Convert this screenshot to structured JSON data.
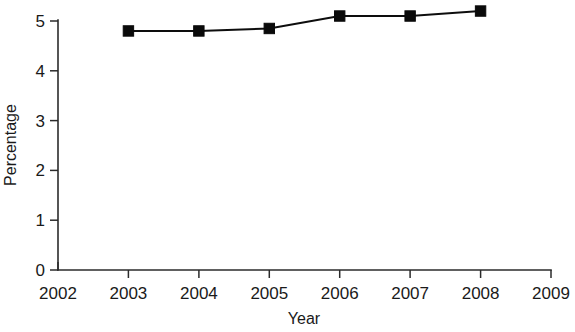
{
  "chart_data": {
    "type": "line",
    "title": "",
    "xlabel": "Year",
    "ylabel": "Percentage",
    "x": [
      2003,
      2004,
      2005,
      2006,
      2007,
      2008
    ],
    "values": [
      4.8,
      4.8,
      4.85,
      5.1,
      5.1,
      5.2
    ],
    "series": [
      {
        "name": "Percentage",
        "values": [
          4.8,
          4.8,
          4.85,
          5.1,
          5.1,
          5.2
        ]
      }
    ],
    "xlim": [
      2002,
      2009
    ],
    "ylim": [
      0,
      5
    ],
    "xticks": [
      2002,
      2003,
      2004,
      2005,
      2006,
      2007,
      2008,
      2009
    ],
    "yticks": [
      0,
      1,
      2,
      3,
      4,
      5
    ],
    "xtick_labels": [
      "2002",
      "2003",
      "2004",
      "2005",
      "2006",
      "2007",
      "2008",
      "2009"
    ],
    "ytick_labels": [
      "0",
      "1",
      "2",
      "3",
      "4",
      "5"
    ],
    "grid": false,
    "legend": false,
    "legend_position": "none",
    "marker": "filled-square",
    "line_color": "#0d0d0d",
    "marker_color": "#0a0a0a",
    "background_color": "#ffffff",
    "annotations": []
  },
  "axes": {
    "y_title": "Percentage",
    "x_title": "Year"
  }
}
